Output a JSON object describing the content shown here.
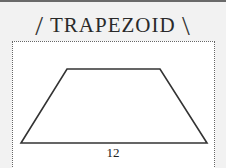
{
  "header": {
    "title": "TRAPEZOID",
    "left_decor": "/",
    "right_decor": "\\"
  },
  "diagram": {
    "shape": "trapezoid",
    "base_label": "12",
    "vertices": [
      [
        21,
        143
      ],
      [
        67,
        69
      ],
      [
        160,
        69
      ],
      [
        207,
        143
      ]
    ],
    "stroke_color": "#333333"
  }
}
